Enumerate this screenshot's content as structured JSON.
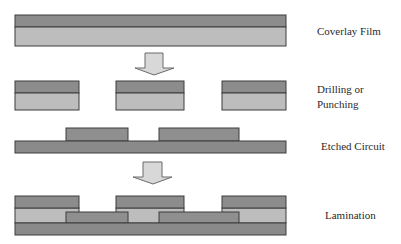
{
  "diagram": {
    "colors": {
      "dark_layer": "#8c8c8c",
      "light_layer": "#bdbdbd",
      "trace": "#8f8f8f",
      "substrate": "#8a8a8a",
      "outline": "#3c3c3c",
      "arrow_fill": "#d8d8d8",
      "arrow_stroke": "#6a6a6a",
      "background": "#ffffff"
    },
    "steps": [
      {
        "id": "coverlay",
        "label": "Coverlay Film"
      },
      {
        "id": "drilling",
        "label_line1": "Drilling or",
        "label_line2": "Punching"
      },
      {
        "id": "etched",
        "label": "Etched Circuit"
      },
      {
        "id": "lamination",
        "label": "Lamination"
      }
    ],
    "arrows": [
      {
        "from": "coverlay",
        "to": "drilling",
        "direction": "down"
      },
      {
        "from": "etched",
        "to": "lamination",
        "direction": "down"
      }
    ]
  }
}
